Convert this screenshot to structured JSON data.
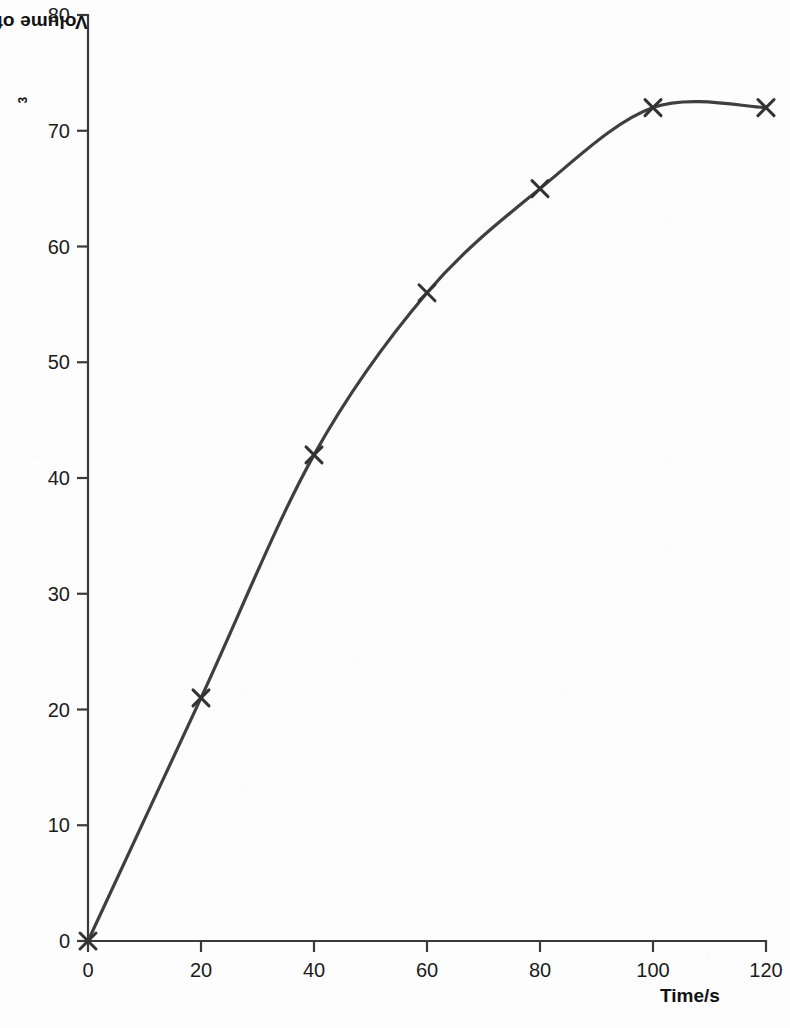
{
  "chart_data": {
    "type": "line",
    "title": "",
    "xlabel": "Time/s",
    "ylabel": "Volume of gas/cm3",
    "ylabel_base": "Volume of gas/cm",
    "ylabel_exponent": "3",
    "x": [
      0,
      20,
      40,
      60,
      80,
      100,
      120
    ],
    "values": [
      0,
      21,
      42,
      56,
      65,
      72,
      72
    ],
    "series": [
      {
        "name": "Volume of gas",
        "values": [
          0,
          21,
          42,
          56,
          65,
          72,
          72
        ]
      }
    ],
    "xlim": [
      0,
      120
    ],
    "ylim": [
      0,
      80
    ],
    "xticks": [
      0,
      20,
      40,
      60,
      80,
      100,
      120
    ],
    "yticks": [
      0,
      10,
      20,
      30,
      40,
      50,
      60,
      70,
      80
    ],
    "xtick_labels": [
      "0",
      "20",
      "40",
      "60",
      "80",
      "100",
      "120"
    ],
    "ytick_labels": [
      "0",
      "10",
      "20",
      "30",
      "40",
      "50",
      "60",
      "70",
      "80"
    ],
    "grid": false,
    "legend": "none",
    "marker": "x",
    "line_color": "#3f3f3f",
    "marker_color": "#333333",
    "axis_color": "#3a3a3a",
    "background_color": "#fdfdfd",
    "smooth": true
  }
}
